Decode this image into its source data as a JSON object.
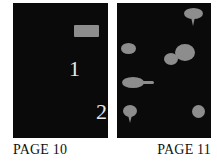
{
  "diagram": {
    "type": "comic-book-two-page-spread-layout",
    "captions": {
      "left_page_label": "PAGE 10",
      "right_page_label": "PAGE 11"
    },
    "colors": {
      "background": "#ffffff",
      "panel_fill": "#0a0a0a",
      "gutter": "#ffffff",
      "balloon_fill": "#8d8d8d",
      "numeral": "#e8e8e8",
      "caption_text": "#111111"
    },
    "left_page": {
      "name": "PAGE 10",
      "panel_count": 1,
      "panels": [
        {
          "id": "lp-panel-1",
          "description": "single full-page splash panel"
        }
      ],
      "numerals": [
        {
          "id": "numeral-1",
          "text": "1"
        },
        {
          "id": "numeral-2",
          "text": "2"
        }
      ],
      "balloons": [
        {
          "id": "lp-caption-box",
          "shape": "rect",
          "description": "rectangular caption box upper right"
        }
      ]
    },
    "right_page": {
      "name": "PAGE 11",
      "panel_count": 7,
      "rows": [
        {
          "row": 1,
          "panels": [
            {
              "id": "rp-r1-p1",
              "description": "wide left panel, empty"
            },
            {
              "id": "rp-r1-p2",
              "description": "right panel with speech balloon"
            }
          ]
        },
        {
          "row": 2,
          "panels": [
            {
              "id": "rp-r2-p1",
              "description": "wide left panel with small ellipse balloon"
            },
            {
              "id": "rp-r2-p2",
              "description": "right panel with overlapping balloon cluster crossing the gutter"
            }
          ]
        },
        {
          "row": 3,
          "panels": [
            {
              "id": "rp-r3-p1",
              "description": "full width panel with ellipse balloon and numeral 3"
            }
          ]
        },
        {
          "row": 4,
          "panels": [
            {
              "id": "rp-r4-p1",
              "description": "left panel with round speech balloon and tail"
            },
            {
              "id": "rp-r4-p2",
              "description": "right panel with round balloon"
            }
          ]
        }
      ],
      "numerals": [
        {
          "id": "numeral-3",
          "text": "3"
        }
      ]
    }
  }
}
